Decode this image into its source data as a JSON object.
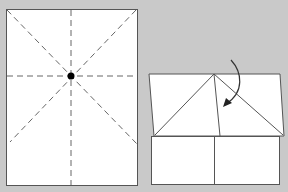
{
  "diagram": {
    "type": "origami-fold-instructions",
    "colors": {
      "background": "#c9c9c9",
      "paper": "#ffffff",
      "line": "#555555",
      "dot": "#000000"
    },
    "steps": [
      {
        "name": "crease-pattern",
        "description": "Rectangle with vertical, horizontal and both diagonal creases (dashed), meeting at center point"
      },
      {
        "name": "fold-corners-down",
        "description": "Top corners folded down to centre line forming a triangle; curved arrow indicates fold"
      }
    ]
  }
}
